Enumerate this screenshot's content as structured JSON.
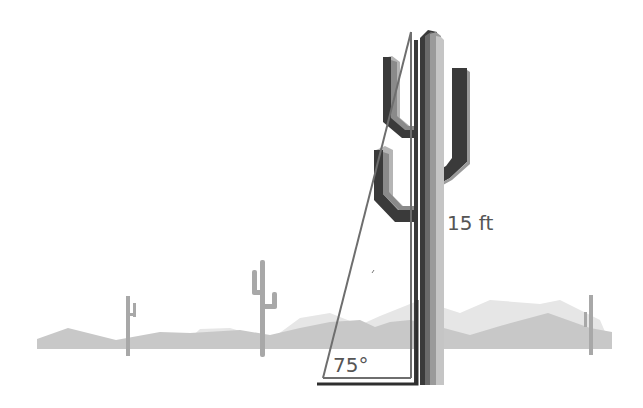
{
  "diagram": {
    "height_label": "15 ft",
    "angle_label": "75°",
    "colors": {
      "background": "#ffffff",
      "far_hills": "#e6e6e6",
      "near_hills": "#c8c8c8",
      "small_cacti": "#a8a8a8",
      "cactus_dark": "#3a3a3a",
      "cactus_mid": "#7a7a7a",
      "cactus_light": "#b5b5b5",
      "triangle_line": "#6e6e6e",
      "base_line": "#2e2e2e",
      "text": "#555555"
    }
  }
}
